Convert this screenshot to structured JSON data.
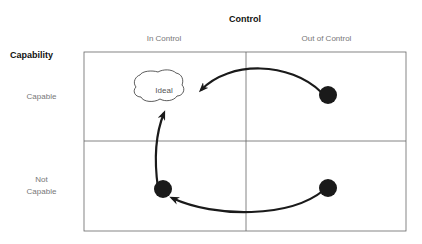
{
  "title": "Control",
  "row_axis_title": "Capability",
  "columns": [
    "In Control",
    "Out of Control"
  ],
  "rows": [
    "Capable",
    "Not\nCapable"
  ],
  "ideal_label": "Ideal",
  "colors": {
    "grid": "#666666",
    "ink": "#1a1a1a",
    "label": "#777777"
  }
}
